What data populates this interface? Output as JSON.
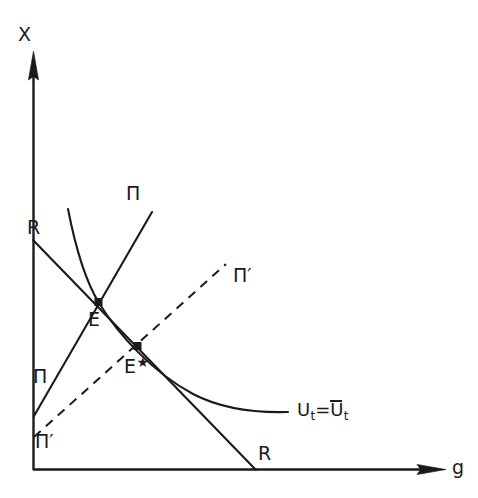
{
  "figure": {
    "type": "economics-phase-diagram",
    "background_color": "#ffffff",
    "stroke_color": "#1a1a1a",
    "axes": {
      "y_axis_label": "X",
      "x_axis_label": "g",
      "origin": [
        33,
        470
      ],
      "x_axis_end": [
        445,
        470
      ],
      "y_axis_top": [
        33,
        52
      ]
    },
    "labels": {
      "x_axis_title": "X",
      "y_axis_title": "g",
      "r_top": "R",
      "r_bottom": "R",
      "pi_top": "Π",
      "pi_bottom": "Π",
      "pi_prime_top": "Π",
      "pi_prime_bottom": "Π",
      "prime_mark": "′",
      "equilibrium": "E",
      "equilibrium_star": "E",
      "star_mark": "★",
      "utility_U": "U",
      "utility_sub": "t",
      "utility_eq": "=",
      "utility_Ubar": "U",
      "utility_bar_sub": "t"
    },
    "curves": [
      {
        "name": "R-locus",
        "label": "R",
        "style": "solid",
        "kind": "line",
        "from": [
          33,
          240
        ],
        "to": [
          255,
          470
        ],
        "passes_through": [
          "E",
          "E*"
        ]
      },
      {
        "name": "Pi-locus",
        "label": "Π",
        "style": "solid",
        "kind": "line",
        "from": [
          34,
          416
        ],
        "to": [
          152,
          212
        ],
        "passes_through": [
          "E"
        ]
      },
      {
        "name": "Pi-prime-locus",
        "label": "Π′",
        "style": "dashed",
        "kind": "line",
        "from": [
          34,
          437
        ],
        "to": [
          225,
          265
        ],
        "passes_through": [
          "E*"
        ]
      },
      {
        "name": "indifference-curve",
        "label": "U_t=Ū_t",
        "style": "solid",
        "kind": "convex-curve",
        "from": [
          68,
          210
        ],
        "to": [
          287,
          412
        ],
        "passes_through": [
          "E"
        ]
      }
    ],
    "points": [
      {
        "name": "E",
        "label": "E",
        "coords": [
          98,
          302
        ],
        "marker": "filled-square"
      },
      {
        "name": "E-star",
        "label": "E★",
        "coords": [
          137,
          346
        ],
        "marker": "filled-square"
      }
    ]
  }
}
